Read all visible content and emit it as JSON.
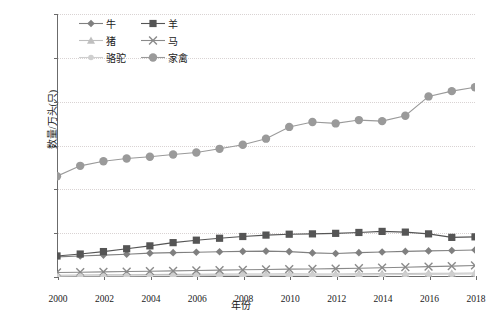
{
  "chart_data": {
    "type": "line",
    "title": "",
    "xlabel": "年份",
    "ylabel": "数量/万头(只)",
    "x": [
      2000,
      2001,
      2002,
      2003,
      2004,
      2005,
      2006,
      2007,
      2008,
      2009,
      2010,
      2011,
      2012,
      2013,
      2014,
      2015,
      2016,
      2017,
      2018
    ],
    "xticks": [
      "2000",
      "2002",
      "2004",
      "2006",
      "2008",
      "2010",
      "2012",
      "2014",
      "2016",
      "2018"
    ],
    "yticks": [
      "0",
      "500",
      "1000",
      "1500",
      "2000",
      "2500",
      "3000"
    ],
    "ylim": [
      0,
      3000
    ],
    "xlim": [
      2000,
      2018
    ],
    "grid": "horizontal-dotted",
    "legend_position": "top-left-inside",
    "series": [
      {
        "name": "牛",
        "marker": "diamond",
        "color": "#808080",
        "values": [
          230,
          240,
          250,
          260,
          272,
          278,
          283,
          288,
          292,
          295,
          290,
          275,
          268,
          278,
          285,
          292,
          298,
          302,
          308
        ]
      },
      {
        "name": "羊",
        "marker": "square",
        "color": "#555555",
        "values": [
          240,
          262,
          290,
          322,
          355,
          392,
          420,
          442,
          462,
          478,
          488,
          492,
          498,
          508,
          520,
          512,
          492,
          452,
          458
        ]
      },
      {
        "name": "猪",
        "marker": "triangle",
        "color": "#bfbfbf",
        "values": [
          20,
          22,
          24,
          26,
          28,
          30,
          32,
          33,
          34,
          35,
          36,
          35,
          34,
          36,
          38,
          40,
          42,
          43,
          45
        ]
      },
      {
        "name": "马",
        "marker": "x",
        "color": "#8a8a8a",
        "values": [
          52,
          55,
          58,
          62,
          66,
          70,
          74,
          78,
          82,
          86,
          90,
          92,
          95,
          100,
          106,
          112,
          118,
          124,
          132
        ]
      },
      {
        "name": "骆驼",
        "marker": "circle-small",
        "color": "#cfcfcf",
        "values": [
          10,
          11,
          12,
          13,
          14,
          15,
          16,
          17,
          18,
          19,
          20,
          21,
          22,
          24,
          26,
          28,
          30,
          32,
          35
        ]
      },
      {
        "name": "家禽",
        "marker": "circle",
        "color": "#9a9a9a",
        "values": [
          1150,
          1268,
          1320,
          1352,
          1372,
          1398,
          1420,
          1462,
          1508,
          1578,
          1712,
          1768,
          1752,
          1790,
          1778,
          1840,
          2060,
          2120,
          2165
        ]
      }
    ]
  },
  "chart_data_poultry_full": {
    "note": "家禽 series extended tail",
    "values_2016_2018": [
      2060,
      2120,
      2165,
      2330,
      2610
    ]
  }
}
